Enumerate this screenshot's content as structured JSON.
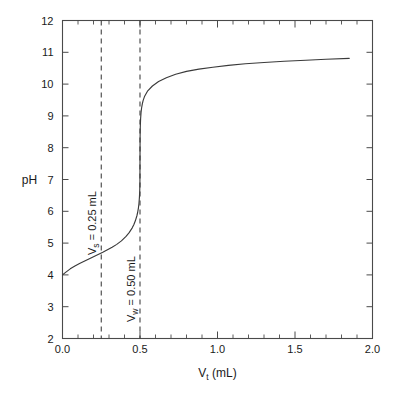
{
  "chart_data": {
    "type": "line",
    "title": "",
    "subtitle": "",
    "xlabel": "V_t (mL)",
    "xlabel_base": "V",
    "xlabel_sub": "t",
    "xlabel_unit": " (mL)",
    "ylabel": "pH",
    "xlim": [
      0.0,
      2.0
    ],
    "ylim": [
      2,
      12
    ],
    "grid": false,
    "legend": "none",
    "x_ticks_major": [
      "0.0",
      "0.5",
      "1.0",
      "1.5",
      "2.0"
    ],
    "x_ticks_major_values": [
      0.0,
      0.5,
      1.0,
      1.5,
      2.0
    ],
    "x_minor_step": 0.1,
    "y_ticks_major": [
      "2",
      "3",
      "4",
      "5",
      "6",
      "7",
      "8",
      "9",
      "10",
      "11",
      "12"
    ],
    "y_ticks_major_values": [
      2,
      3,
      4,
      5,
      6,
      7,
      8,
      9,
      10,
      11,
      12
    ],
    "series": [
      {
        "name": "titration curve",
        "x": [
          0.0,
          0.02,
          0.05,
          0.08,
          0.11,
          0.14,
          0.17,
          0.2,
          0.23,
          0.26,
          0.29,
          0.32,
          0.35,
          0.38,
          0.41,
          0.43,
          0.45,
          0.46,
          0.47,
          0.48,
          0.485,
          0.49,
          0.493,
          0.496,
          0.498,
          0.499,
          0.4995,
          0.5,
          0.5005,
          0.501,
          0.502,
          0.504,
          0.507,
          0.51,
          0.515,
          0.52,
          0.53,
          0.55,
          0.58,
          0.62,
          0.67,
          0.73,
          0.8,
          0.88,
          0.97,
          1.07,
          1.18,
          1.3,
          1.43,
          1.57,
          1.7,
          1.85
        ],
        "y": [
          4.0,
          4.08,
          4.19,
          4.28,
          4.36,
          4.43,
          4.5,
          4.57,
          4.64,
          4.71,
          4.79,
          4.87,
          4.96,
          5.07,
          5.21,
          5.33,
          5.48,
          5.58,
          5.7,
          5.86,
          5.97,
          6.11,
          6.23,
          6.42,
          6.6,
          6.78,
          6.92,
          7.6,
          8.28,
          8.46,
          8.68,
          8.92,
          9.12,
          9.24,
          9.38,
          9.48,
          9.62,
          9.79,
          9.94,
          10.08,
          10.2,
          10.31,
          10.4,
          10.47,
          10.53,
          10.59,
          10.64,
          10.68,
          10.72,
          10.75,
          10.78,
          10.81
        ]
      }
    ],
    "annotations": [
      {
        "name": "vs-marker",
        "kind": "vertical-dashed-line",
        "x_value": 0.25,
        "label": "V_s = 0.25 mL",
        "label_base": "V",
        "label_sub": "s",
        "label_rest": " = 0.25 mL",
        "orientation": "vertical-text"
      },
      {
        "name": "vw-marker",
        "kind": "vertical-dashed-line",
        "x_value": 0.5,
        "label": "V_w = 0.50 mL",
        "label_base": "V",
        "label_sub": "w",
        "label_rest": " = 0.50 mL",
        "orientation": "vertical-text"
      }
    ],
    "colors": {
      "background": "#ffffff",
      "curve": "#3a3a3a",
      "axis": "#4a4a4a",
      "text": "#1a1a1a",
      "dashed_line": "#3a3a3a"
    }
  }
}
